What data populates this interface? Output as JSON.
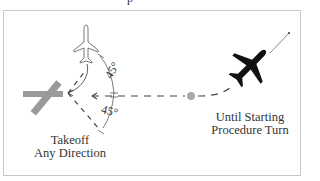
{
  "figure": {
    "top_text_fragment": "p",
    "labels": {
      "takeoff_line1": "Takeoff",
      "takeoff_line2": "Any Direction",
      "right_line1": "Until Starting",
      "right_line2": "Procedure Turn"
    },
    "angles": {
      "upper": "45°",
      "lower": "45°"
    },
    "colors": {
      "runway": "#9a9a9a",
      "fix_dot": "#a8a8a8",
      "aircraft_dark": "#111111",
      "aircraft_outline": "#555555",
      "dashes": "#444444",
      "frame": "#c8c8c8"
    },
    "elements": [
      "runway-cross",
      "outline-aircraft",
      "black-aircraft",
      "fix-dot",
      "dashed-inbound-track",
      "45-degree-sector"
    ]
  }
}
